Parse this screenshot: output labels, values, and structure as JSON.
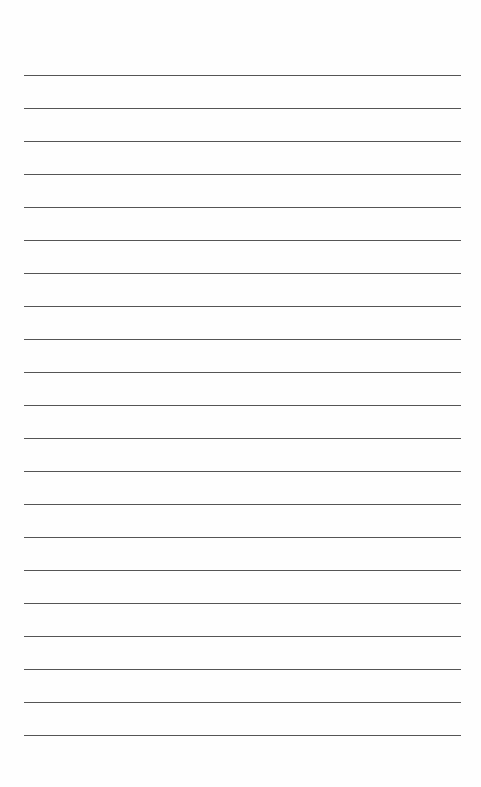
{
  "page": {
    "type": "lined-paper",
    "line_count": 21,
    "first_line_y": 75,
    "line_spacing": 33,
    "line_left": 24,
    "line_width": 437,
    "line_color": "#555555",
    "background_color": "#fefefe"
  }
}
